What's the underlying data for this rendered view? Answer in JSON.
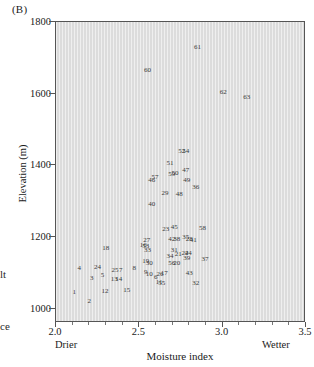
{
  "panel": {
    "label": "(B)"
  },
  "edge_fragments": {
    "upper": "lt",
    "lower": "ce"
  },
  "axes": {
    "y": {
      "title": "Elevation (m)",
      "ticks": [
        1000,
        1200,
        1400,
        1600,
        1800
      ],
      "tick_labels": [
        "1000",
        "1200",
        "1400",
        "1600",
        "1800"
      ],
      "min": 960,
      "max": 1800
    },
    "x": {
      "title": "Moisture index",
      "ticks": [
        2.0,
        2.5,
        3.0,
        3.5
      ],
      "tick_labels": [
        "2.0",
        "2.5",
        "3.0",
        "3.5"
      ],
      "minor_ticks": [
        2.1,
        2.2,
        2.3,
        2.4,
        2.6,
        2.7,
        2.8,
        2.9,
        3.1,
        3.2,
        3.3,
        3.4
      ],
      "low_label": "Drier",
      "high_label": "Wetter",
      "min": 2.0,
      "max": 3.5
    }
  },
  "chart_data": {
    "type": "scatter",
    "title": "(B)",
    "xlabel": "Moisture index",
    "ylabel": "Elevation (m)",
    "xlim": [
      2.0,
      3.5
    ],
    "ylim": [
      960,
      1800
    ],
    "grid": false,
    "legend": null,
    "marker_style": "numeric-text-labels",
    "annotations": [
      "Drier",
      "Wetter"
    ],
    "point_label_field": "id",
    "points": [
      {
        "id": "1",
        "x": 2.115,
        "y": 1043
      },
      {
        "id": "2",
        "x": 2.205,
        "y": 1018
      },
      {
        "id": "3",
        "x": 2.22,
        "y": 1083
      },
      {
        "id": "4",
        "x": 2.145,
        "y": 1110
      },
      {
        "id": "5",
        "x": 2.285,
        "y": 1090
      },
      {
        "id": "6",
        "x": 2.605,
        "y": 1085
      },
      {
        "id": "7",
        "x": 2.395,
        "y": 1105
      },
      {
        "id": "8",
        "x": 2.475,
        "y": 1112
      },
      {
        "id": "9",
        "x": 2.545,
        "y": 1100
      },
      {
        "id": "10",
        "x": 2.565,
        "y": 1093
      },
      {
        "id": "11",
        "x": 2.625,
        "y": 1073
      },
      {
        "id": "12",
        "x": 2.3,
        "y": 1047
      },
      {
        "id": "13",
        "x": 2.355,
        "y": 1081
      },
      {
        "id": "14",
        "x": 2.382,
        "y": 1081
      },
      {
        "id": "15",
        "x": 2.43,
        "y": 1048
      },
      {
        "id": "16",
        "x": 2.53,
        "y": 1176
      },
      {
        "id": "17",
        "x": 2.655,
        "y": 1098
      },
      {
        "id": "18",
        "x": 2.305,
        "y": 1167
      },
      {
        "id": "19",
        "x": 2.545,
        "y": 1129
      },
      {
        "id": "20",
        "x": 2.73,
        "y": 1126
      },
      {
        "id": "21",
        "x": 2.74,
        "y": 1151
      },
      {
        "id": "22",
        "x": 2.78,
        "y": 1152
      },
      {
        "id": "23",
        "x": 2.665,
        "y": 1219
      },
      {
        "id": "24",
        "x": 2.255,
        "y": 1113
      },
      {
        "id": "25",
        "x": 2.36,
        "y": 1105
      },
      {
        "id": "26",
        "x": 2.63,
        "y": 1094
      },
      {
        "id": "27",
        "x": 2.55,
        "y": 1190
      },
      {
        "id": "28",
        "x": 2.805,
        "y": 1193
      },
      {
        "id": "29",
        "x": 2.66,
        "y": 1320
      },
      {
        "id": "30",
        "x": 2.565,
        "y": 1124
      },
      {
        "id": "31",
        "x": 2.715,
        "y": 1160
      },
      {
        "id": "32",
        "x": 2.845,
        "y": 1070
      },
      {
        "id": "33",
        "x": 2.555,
        "y": 1160
      },
      {
        "id": "34",
        "x": 2.69,
        "y": 1145
      },
      {
        "id": "35",
        "x": 2.785,
        "y": 1198
      },
      {
        "id": "36",
        "x": 2.845,
        "y": 1337
      },
      {
        "id": "37",
        "x": 2.9,
        "y": 1137
      },
      {
        "id": "38",
        "x": 2.73,
        "y": 1192
      },
      {
        "id": "39",
        "x": 2.79,
        "y": 1140
      },
      {
        "id": "40",
        "x": 2.58,
        "y": 1288
      },
      {
        "id": "41",
        "x": 2.83,
        "y": 1190
      },
      {
        "id": "42",
        "x": 2.7,
        "y": 1192
      },
      {
        "id": "43",
        "x": 2.805,
        "y": 1098
      },
      {
        "id": "44",
        "x": 2.8,
        "y": 1152
      },
      {
        "id": "45",
        "x": 2.715,
        "y": 1225
      },
      {
        "id": "46",
        "x": 2.58,
        "y": 1355
      },
      {
        "id": "47",
        "x": 2.785,
        "y": 1385
      },
      {
        "id": "48",
        "x": 2.745,
        "y": 1318
      },
      {
        "id": "49",
        "x": 2.79,
        "y": 1357
      },
      {
        "id": "50",
        "x": 2.72,
        "y": 1375
      },
      {
        "id": "51",
        "x": 2.69,
        "y": 1403
      },
      {
        "id": "52",
        "x": 2.76,
        "y": 1437
      },
      {
        "id": "53",
        "x": 2.545,
        "y": 1173
      },
      {
        "id": "54",
        "x": 2.785,
        "y": 1437
      },
      {
        "id": "55",
        "x": 2.64,
        "y": 1070
      },
      {
        "id": "56",
        "x": 2.7,
        "y": 1126
      },
      {
        "id": "57",
        "x": 2.6,
        "y": 1365
      },
      {
        "id": "58",
        "x": 2.885,
        "y": 1222
      },
      {
        "id": "59",
        "x": 2.7,
        "y": 1372
      },
      {
        "id": "60",
        "x": 2.555,
        "y": 1663
      },
      {
        "id": "61",
        "x": 2.855,
        "y": 1727
      },
      {
        "id": "62",
        "x": 3.01,
        "y": 1603
      },
      {
        "id": "63",
        "x": 3.15,
        "y": 1588
      }
    ]
  }
}
